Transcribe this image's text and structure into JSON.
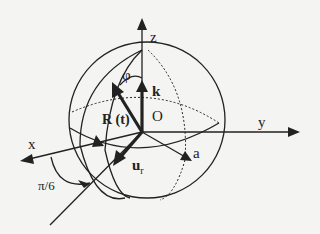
{
  "figure": {
    "labels": {
      "z": "z",
      "y": "y",
      "x": "x",
      "origin": "O",
      "phi": "φ",
      "k": "k",
      "R": "R (t)",
      "ur": "u",
      "ur_sub": "r",
      "a": "a",
      "angle": "π/6"
    }
  }
}
